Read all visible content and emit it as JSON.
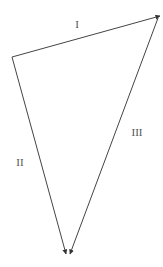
{
  "diagram": {
    "type": "vector-triangle",
    "colors": {
      "line": "#444444",
      "label": "#555555",
      "background": "#ffffff"
    },
    "vectors": [
      {
        "id": "I",
        "label": "I",
        "from": [
          12,
          57
        ],
        "to": [
          160,
          16
        ],
        "label_pos": [
          77,
          24
        ]
      },
      {
        "id": "II",
        "label": "II",
        "from": [
          12,
          57
        ],
        "to": [
          66,
          254
        ],
        "label_pos": [
          20,
          162
        ]
      },
      {
        "id": "III",
        "label": "III",
        "from": [
          158,
          18
        ],
        "to": [
          70,
          254
        ],
        "label_pos": [
          137,
          132
        ]
      }
    ]
  }
}
